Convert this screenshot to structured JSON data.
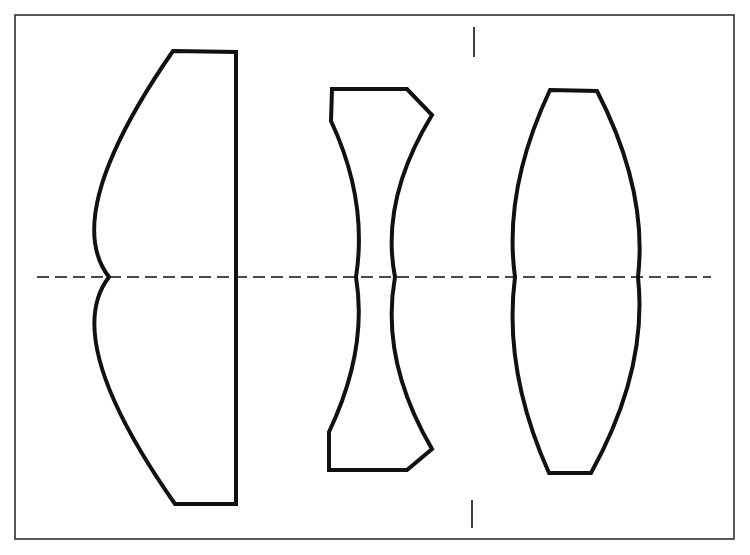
{
  "diagram": {
    "type": "optical-lens-cross-section",
    "colors": {
      "stroke": "#111111",
      "background": "#ffffff",
      "frame": "#222222"
    },
    "frame": {
      "x": 15,
      "y": 15,
      "width": 719,
      "height": 524
    },
    "optical_axis": {
      "y": 277,
      "x_start": 37,
      "x_end": 711,
      "dash": "12 6"
    },
    "stop_markers": [
      {
        "x": 474,
        "y1": 27,
        "y2": 57
      },
      {
        "x": 472,
        "y1": 500,
        "y2": 528
      }
    ],
    "lenses": [
      {
        "id": "lens-1",
        "kind": "plano-convex positive element"
      },
      {
        "id": "lens-2",
        "kind": "biconcave negative element"
      },
      {
        "id": "lens-3",
        "kind": "biconvex positive element"
      }
    ]
  }
}
